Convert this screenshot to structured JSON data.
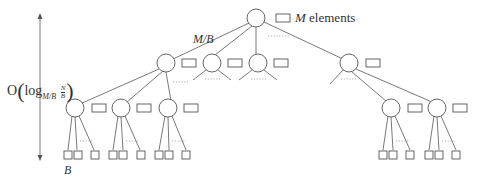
{
  "diagram": {
    "type": "tree",
    "root_label": {
      "var": "M",
      "text": "elements"
    },
    "fanout_label": "M/B",
    "leaf_label": "B",
    "height_label": {
      "prefix": "O",
      "log": "log",
      "base": "M/B",
      "frac_num": "N",
      "frac_den": "B"
    },
    "levels": [
      {
        "level": 0,
        "nodes": 1,
        "each_has_buffer": true
      },
      {
        "level": 1,
        "nodes_shown": 4,
        "each_has_buffer": true
      },
      {
        "level": 2,
        "nodes_shown": 5,
        "each_has_buffer": true
      },
      {
        "level": 3,
        "leaves_per_node": 3,
        "leaf_shape": "square"
      }
    ],
    "colors": {
      "stroke": "#555555",
      "dots": "#9a9a9a",
      "text": "#333333"
    }
  }
}
